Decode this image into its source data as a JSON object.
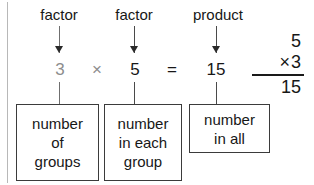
{
  "diagram": {
    "labels": [
      {
        "id": "label-factor-1",
        "text": "factor"
      },
      {
        "id": "label-factor-2",
        "text": "factor"
      },
      {
        "id": "label-product",
        "text": "product"
      }
    ],
    "equation": {
      "terms": [
        {
          "id": "term-factor-1",
          "text": "3",
          "tone": "dim"
        },
        {
          "id": "operator-times",
          "text": "×",
          "tone": "dim"
        },
        {
          "id": "term-factor-2",
          "text": "5",
          "tone": "normal"
        },
        {
          "id": "operator-equals",
          "text": "=",
          "tone": "normal"
        },
        {
          "id": "term-product",
          "text": "15",
          "tone": "normal"
        }
      ]
    },
    "definition_boxes": [
      {
        "id": "box-number-of-groups",
        "lines": [
          "number",
          "of",
          "groups"
        ]
      },
      {
        "id": "box-number-in-each-group",
        "lines": [
          "number",
          "in each",
          "group"
        ]
      },
      {
        "id": "box-number-in-all",
        "lines": [
          "number",
          "in all"
        ]
      }
    ],
    "column_multiplication": {
      "multiplicand": "5",
      "operator": "×",
      "multiplier": "3",
      "product": "15"
    },
    "colors": {
      "ink": "#171717",
      "dim_ink": "#8d8d8d",
      "rule": "#3b3b3b",
      "connector": "#6f6f6f",
      "background": "#ffffff"
    }
  }
}
